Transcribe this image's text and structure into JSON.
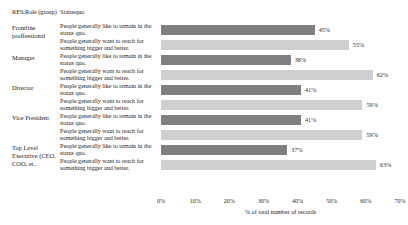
{
  "headers": {
    "role_column": "RES:Role (group)",
    "category_column": "Statusquo"
  },
  "colors": {
    "status_quo_bar": "#808080",
    "reach_bigger_bar": "#cfcfcf",
    "text": "#1a1a1a",
    "background": "#ffffff"
  },
  "chart_data": {
    "type": "bar",
    "orientation": "horizontal",
    "title": "",
    "xlabel": "% of total number of records",
    "ylabel": "",
    "xlim": [
      0,
      70
    ],
    "xticks": [
      0,
      10,
      20,
      30,
      40,
      50,
      60,
      70
    ],
    "xtick_labels": [
      "0%",
      "10%",
      "20%",
      "30%",
      "40%",
      "50%",
      "60%",
      "70%"
    ],
    "grid": false,
    "legend": "none",
    "categories": [
      "People generally like to remain in the status quo.",
      "People generally want to reach for something bigger and better."
    ],
    "groups": [
      {
        "role": "Frontline proffessional",
        "rows": [
          {
            "category": "People generally like to remain in the status quo.",
            "value": 45,
            "label": "45%"
          },
          {
            "category": "People generally want to reach for something bigger and better.",
            "value": 55,
            "label": "55%"
          }
        ]
      },
      {
        "role": "Manager",
        "rows": [
          {
            "category": "People generally like to remain in the status quo.",
            "value": 38,
            "label": "38%"
          },
          {
            "category": "People generally want to reach for something bigger and better.",
            "value": 62,
            "label": "62%"
          }
        ]
      },
      {
        "role": "Director",
        "rows": [
          {
            "category": "People generally like to remain in the status quo.",
            "value": 41,
            "label": "41%"
          },
          {
            "category": "People generally want to reach for something bigger and better.",
            "value": 59,
            "label": "59%"
          }
        ]
      },
      {
        "role": "Vice President",
        "rows": [
          {
            "category": "People generally like to remain in the status quo.",
            "value": 41,
            "label": "41%"
          },
          {
            "category": "People generally want to reach for something bigger and better.",
            "value": 59,
            "label": "59%"
          }
        ]
      },
      {
        "role": "Top Level Executive (CEO, COO, et..",
        "rows": [
          {
            "category": "People generally like to remain in the status quo.",
            "value": 37,
            "label": "37%"
          },
          {
            "category": "People generally want to reach for something bigger and better.",
            "value": 63,
            "label": "63%"
          }
        ]
      }
    ]
  }
}
